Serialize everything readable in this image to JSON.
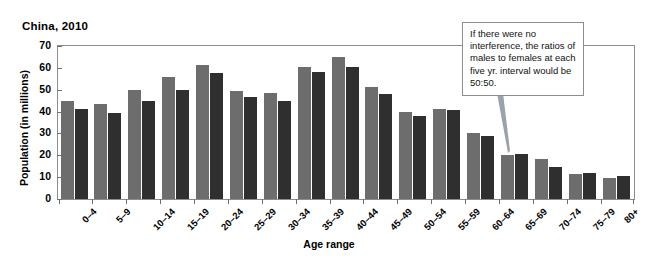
{
  "chart_data": {
    "type": "bar",
    "title": "China, 2010",
    "xlabel": "Age range",
    "ylabel": "Population (in millions)",
    "ylim": [
      0,
      70
    ],
    "yticks": [
      0,
      10,
      20,
      30,
      40,
      50,
      60,
      70
    ],
    "grid": false,
    "legend": "none",
    "categories": [
      "0–4",
      "5–9",
      "10–14",
      "15–19",
      "20–24",
      "25–29",
      "30–34",
      "35–39",
      "40–44",
      "45–49",
      "50–54",
      "55–59",
      "60–64",
      "65–69",
      "70–74",
      "75–79",
      "80+"
    ],
    "series": [
      {
        "name": "Males",
        "color": "#6d6d6d",
        "values": [
          44.7,
          43.5,
          49.7,
          55.6,
          61.3,
          49.6,
          48.3,
          60.3,
          65.0,
          51.3,
          39.8,
          41.1,
          30.3,
          20.2,
          18.3,
          11.3,
          9.5
        ]
      },
      {
        "name": "Females",
        "color": "#2f2f2f",
        "values": [
          41.3,
          39.3,
          45.0,
          49.8,
          57.8,
          46.8,
          44.9,
          58.0,
          60.2,
          48.0,
          38.1,
          40.7,
          28.7,
          20.4,
          14.8,
          11.8,
          10.7
        ]
      }
    ],
    "annotations": [
      {
        "name": "interference-note",
        "text": "If there were no interference, the ratios of males to females at each five yr. interval would be 50:50.",
        "points_to": "65–69"
      }
    ]
  }
}
